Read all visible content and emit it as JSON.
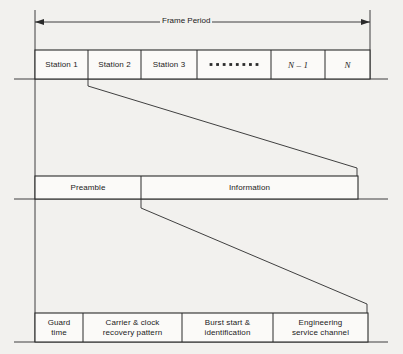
{
  "figure": {
    "kind": "tdma-frame-structure-diagram",
    "background_color": "#f2f1ee",
    "line_color": "#2b2b2b",
    "text_color": "#1b1b1b"
  },
  "frame_period": {
    "label": "Frame Period",
    "arrow_left_x": 35,
    "arrow_right_x": 370,
    "arrow_y": 22
  },
  "rows": [
    {
      "name": "frame-row",
      "y_top": 50,
      "y_bottom": 79,
      "x_start": 35,
      "x_end": 370,
      "cells": [
        {
          "label": "Station 1",
          "x": 35,
          "width": 53,
          "style": "plain"
        },
        {
          "label": "Station 2",
          "x": 88,
          "width": 53,
          "style": "plain"
        },
        {
          "label": "Station 3",
          "x": 141,
          "width": 56,
          "style": "plain"
        },
        {
          "label": "",
          "x": 197,
          "width": 74,
          "style": "ellipsis",
          "dots": 8
        },
        {
          "label": "N – 1",
          "x": 271,
          "width": 54,
          "style": "italic"
        },
        {
          "label": "N",
          "x": 325,
          "width": 45,
          "style": "italic"
        }
      ]
    },
    {
      "name": "burst-row",
      "y_top": 176,
      "y_bottom": 199,
      "x_start": 35,
      "x_end": 358,
      "cells": [
        {
          "label": "Preamble",
          "x": 35,
          "width": 106,
          "style": "plain"
        },
        {
          "label": "Information",
          "x": 141,
          "width": 217,
          "style": "plain"
        }
      ]
    },
    {
      "name": "preamble-detail-row",
      "y_top": 313,
      "y_bottom": 342,
      "x_start": 35,
      "x_end": 368,
      "cells": [
        {
          "label": "Guard\ntime",
          "x": 35,
          "width": 48,
          "style": "plain"
        },
        {
          "label": "Carrier & clock\nrecovery pattern",
          "x": 83,
          "width": 99,
          "style": "plain"
        },
        {
          "label": "Burst start &\nidentification",
          "x": 182,
          "width": 91,
          "style": "plain"
        },
        {
          "label": "Engineering\nservice channel",
          "x": 273,
          "width": 95,
          "style": "plain"
        }
      ]
    }
  ],
  "connectors": [
    {
      "name": "station2-to-burst-connector",
      "from_x": 88,
      "from_y": 79,
      "drop_y": 86,
      "to_x": 357,
      "to_y": 168,
      "end_y": 176
    },
    {
      "name": "preamble-to-detail-connector",
      "from_x": 141,
      "from_y": 199,
      "drop_y": 208,
      "to_x": 367,
      "to_y": 304,
      "end_y": 313
    }
  ],
  "guides": {
    "left_vertical_x": 35,
    "right_vertical_x": 370,
    "baseline_extensions": [
      {
        "name": "frame-row-baseline",
        "y": 79,
        "x1": 14,
        "x2": 388
      },
      {
        "name": "burst-row-baseline",
        "y": 199,
        "x1": 14,
        "x2": 388
      },
      {
        "name": "detail-row-baseline",
        "y": 342,
        "x1": 14,
        "x2": 388
      }
    ]
  }
}
